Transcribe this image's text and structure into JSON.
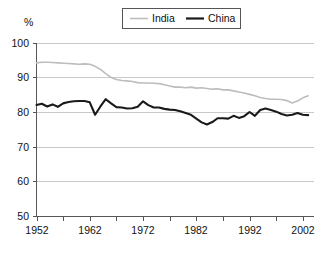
{
  "chart_data": {
    "type": "line",
    "title": "",
    "subtitle": "",
    "xlabel": "",
    "ylabel": "%",
    "ylim": [
      50,
      100
    ],
    "xlim": [
      1952,
      2004
    ],
    "yticks": [
      50,
      60,
      70,
      80,
      90,
      100
    ],
    "xticks": [
      1952,
      1962,
      1972,
      1982,
      1992,
      2002
    ],
    "x_minor_tick_interval": 5,
    "grid": "horizontal",
    "legend_position": "top-center",
    "legend_entries": [
      "India",
      "China"
    ],
    "series": [
      {
        "name": "India",
        "color": "#bdbdbd",
        "x": [
          1952,
          1953,
          1954,
          1955,
          1956,
          1957,
          1958,
          1959,
          1960,
          1961,
          1962,
          1963,
          1964,
          1965,
          1966,
          1967,
          1968,
          1969,
          1970,
          1971,
          1972,
          1973,
          1974,
          1975,
          1976,
          1977,
          1978,
          1979,
          1980,
          1981,
          1982,
          1983,
          1984,
          1985,
          1986,
          1987,
          1988,
          1989,
          1990,
          1991,
          1992,
          1993,
          1994,
          1995,
          1996,
          1997,
          1998,
          1999,
          2000,
          2001,
          2002,
          2003
        ],
        "values": [
          94.4,
          94.6,
          94.6,
          94.5,
          94.4,
          94.3,
          94.2,
          94.1,
          94.0,
          94.1,
          94.0,
          93.4,
          92.5,
          91.3,
          90.2,
          89.6,
          89.3,
          89.2,
          89.0,
          88.7,
          88.6,
          88.6,
          88.5,
          88.4,
          88.1,
          87.7,
          87.4,
          87.4,
          87.2,
          87.4,
          87.1,
          87.2,
          87.0,
          86.8,
          86.9,
          86.6,
          86.6,
          86.3,
          86.0,
          85.7,
          85.3,
          84.9,
          84.4,
          84.1,
          83.9,
          83.9,
          83.8,
          83.5,
          82.8,
          83.4,
          84.3,
          84.9
        ]
      },
      {
        "name": "China",
        "color": "#1a1a1a",
        "x": [
          1952,
          1953,
          1954,
          1955,
          1956,
          1957,
          1958,
          1959,
          1960,
          1961,
          1962,
          1963,
          1964,
          1965,
          1966,
          1967,
          1968,
          1969,
          1970,
          1971,
          1972,
          1973,
          1974,
          1975,
          1976,
          1977,
          1978,
          1979,
          1980,
          1981,
          1982,
          1983,
          1984,
          1985,
          1986,
          1987,
          1988,
          1989,
          1990,
          1991,
          1992,
          1993,
          1994,
          1995,
          1996,
          1997,
          1998,
          1999,
          2000,
          2001,
          2002,
          2003
        ],
        "values": [
          82.2,
          82.6,
          81.8,
          82.4,
          81.7,
          82.7,
          83.1,
          83.3,
          83.4,
          83.4,
          83.0,
          79.4,
          81.8,
          83.9,
          82.7,
          81.6,
          81.5,
          81.2,
          81.3,
          81.7,
          83.3,
          82.2,
          81.5,
          81.5,
          81.1,
          80.9,
          80.8,
          80.4,
          79.9,
          79.4,
          78.3,
          77.2,
          76.6,
          77.3,
          78.4,
          78.4,
          78.3,
          79.1,
          78.5,
          79.0,
          80.2,
          79.1,
          80.8,
          81.2,
          80.8,
          80.3,
          79.6,
          79.2,
          79.4,
          79.9,
          79.4,
          79.3
        ]
      }
    ]
  },
  "axis": {
    "y_title": "%",
    "y_tick_labels": [
      "100",
      "90",
      "80",
      "70",
      "60",
      "50"
    ],
    "x_tick_labels": [
      "1952",
      "1962",
      "1972",
      "1982",
      "1992",
      "2002"
    ]
  },
  "legend": {
    "items": [
      {
        "label": "India",
        "swatch": "line-swatch-light"
      },
      {
        "label": "China",
        "swatch": "line-swatch-dark"
      }
    ]
  }
}
